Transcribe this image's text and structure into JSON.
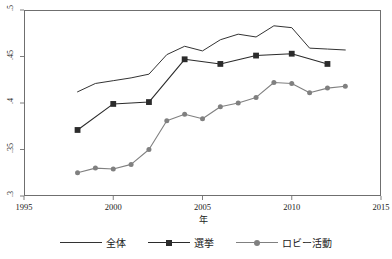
{
  "chart_data": {
    "type": "line",
    "title": "",
    "xlabel": "年",
    "ylabel": "",
    "xlim": [
      1995,
      2015
    ],
    "ylim": [
      0.3,
      0.5
    ],
    "xticks": [
      1995,
      2000,
      2005,
      2010,
      2015
    ],
    "xtick_labels": [
      "1995",
      "2000",
      "2005",
      "2010",
      "2015"
    ],
    "yticks": [
      0.3,
      0.35,
      0.4,
      0.45,
      0.5
    ],
    "ytick_labels": [
      ".3",
      ".35",
      ".4",
      ".45",
      ".5"
    ],
    "grid": false,
    "legend_position": "bottom",
    "series": [
      {
        "name": "全体",
        "marker": "none",
        "color": "#333333",
        "x": [
          1998,
          1999,
          2000,
          2001,
          2002,
          2003,
          2004,
          2005,
          2006,
          2007,
          2008,
          2009,
          2010,
          2011,
          2012,
          2013
        ],
        "values": [
          0.412,
          0.421,
          0.424,
          0.427,
          0.431,
          0.452,
          0.461,
          0.456,
          0.468,
          0.474,
          0.471,
          0.483,
          0.481,
          0.459,
          0.458,
          0.457
        ]
      },
      {
        "name": "選挙",
        "marker": "square",
        "color": "#2b2b2b",
        "x": [
          1998,
          2000,
          2002,
          2004,
          2006,
          2008,
          2010,
          2012
        ],
        "values": [
          0.371,
          0.399,
          0.401,
          0.447,
          0.442,
          0.451,
          0.453,
          0.442
        ]
      },
      {
        "name": "ロビー活動",
        "marker": "circle",
        "color": "#808080",
        "x": [
          1998,
          1999,
          2000,
          2001,
          2002,
          2003,
          2004,
          2005,
          2006,
          2007,
          2008,
          2009,
          2010,
          2011,
          2012,
          2013
        ],
        "values": [
          0.325,
          0.33,
          0.329,
          0.334,
          0.35,
          0.381,
          0.388,
          0.383,
          0.396,
          0.4,
          0.406,
          0.422,
          0.421,
          0.411,
          0.416,
          0.418
        ]
      }
    ]
  },
  "legend": {
    "items": [
      {
        "label": "全体",
        "marker": "none"
      },
      {
        "label": "選挙",
        "marker": "square"
      },
      {
        "label": "ロビー活動",
        "marker": "circle"
      }
    ]
  },
  "colors": {
    "series_all": "#333333",
    "series_election": "#2b2b2b",
    "series_lobby": "#808080",
    "axis": "#6f6f6f",
    "text": "#1a1a1a",
    "background": "#ffffff"
  }
}
